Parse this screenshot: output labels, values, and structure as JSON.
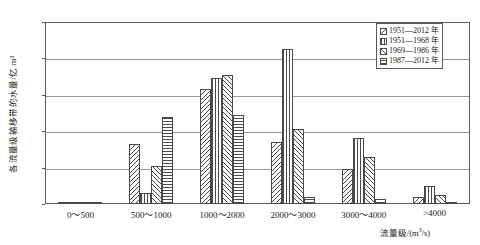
{
  "chart_data": {
    "type": "bar",
    "title": "",
    "xlabel": "流量级/(m³/s)",
    "ylabel": "各流量级输移带的水量/亿 m³",
    "categories": [
      "0～500",
      "500～1000",
      "1000～2000",
      "2000～3000",
      "3000～4000",
      ">4000"
    ],
    "series": [
      {
        "name": "1951—2012 年",
        "pattern": "backslash",
        "values": [
          0.5,
          33,
          63,
          34,
          19,
          4
        ]
      },
      {
        "name": "1951—1968 年",
        "pattern": "vertical",
        "values": [
          0.8,
          6,
          69,
          85,
          36,
          10
        ]
      },
      {
        "name": "1969—1986 年",
        "pattern": "slash",
        "values": [
          0.4,
          21,
          71,
          41,
          26,
          5
        ]
      },
      {
        "name": "1987—2012 年",
        "pattern": "horizontal",
        "values": [
          0.2,
          48,
          49,
          4,
          3,
          0.5
        ]
      }
    ],
    "ylim": [
      0,
      100
    ],
    "yticks": [
      0,
      20,
      40,
      60,
      80,
      100
    ],
    "grid": true,
    "legend_position": "top-right"
  },
  "legend": {
    "items": [
      {
        "label": "1951—2012 年"
      },
      {
        "label": "1951—1968 年"
      },
      {
        "label": "1969—1986 年"
      },
      {
        "label": "1987—2012 年"
      }
    ]
  },
  "axes": {
    "y_title": "各流量级输移带的水量/亿 m³",
    "x_title_main": "流量级/(m",
    "x_title_sup": "3",
    "x_title_tail": "/s)"
  }
}
